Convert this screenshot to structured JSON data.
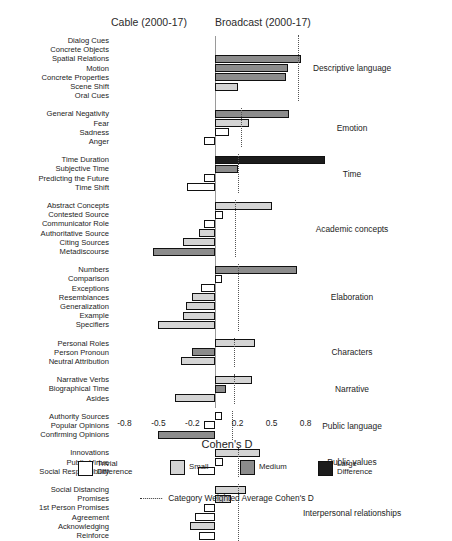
{
  "headers": {
    "left": "Cable (2000-17)",
    "right": "Broadcast (2000-17)"
  },
  "axis": {
    "title": "Cohen's D",
    "ticks": [
      "-0.8",
      "-0.5",
      "-0.2",
      "0.2",
      "0.5",
      "0.8"
    ],
    "tick_values": [
      -0.8,
      -0.5,
      -0.2,
      0.2,
      0.5,
      0.8
    ],
    "xlim": [
      -0.95,
      1.05
    ]
  },
  "legend": {
    "items": [
      {
        "key": "trivial",
        "label": "Trivial\nDifference",
        "color": "#ffffff"
      },
      {
        "key": "small",
        "label": "Small",
        "color": "#d4d4d4"
      },
      {
        "key": "medium",
        "label": "Medium",
        "color": "#8c8c8c"
      },
      {
        "key": "large",
        "label": "Large\nDifference",
        "color": "#1c1c1c"
      }
    ],
    "average_line": "Category Weighted Average Cohen's D"
  },
  "chart_data": {
    "type": "bar",
    "orientation": "horizontal",
    "title": "",
    "xlabel": "Cohen's D",
    "ylabel": "",
    "xlim": [
      -0.95,
      1.05
    ],
    "grid": false,
    "legend_position": "bottom",
    "annotations": [
      "Cable (2000-17)",
      "Broadcast (2000-17)"
    ],
    "effect_bins": {
      "trivial": "< 0.2",
      "small": "0.2 - 0.5",
      "medium": "0.5 - 0.8",
      "large": "> 0.8"
    },
    "groups": [
      {
        "category": "Descriptive language",
        "weighted_average": 0.73,
        "categories": [
          "Dialog Cues",
          "Concrete Objects",
          "Spatial Relations",
          "Motion",
          "Concrete Properties",
          "Scene Shift",
          "Oral Cues"
        ],
        "values": [
          0.0,
          0.0,
          0.76,
          0.64,
          0.63,
          0.2,
          0.0
        ],
        "effects": [
          "trivial",
          "trivial",
          "medium",
          "medium",
          "medium",
          "small",
          "trivial"
        ]
      },
      {
        "category": "Emotion",
        "weighted_average": 0.23,
        "categories": [
          "General Negativity",
          "Fear",
          "Sadness",
          "Anger"
        ],
        "values": [
          0.65,
          0.3,
          0.12,
          -0.1
        ],
        "effects": [
          "medium",
          "small",
          "trivial",
          "trivial"
        ]
      },
      {
        "category": "Time",
        "weighted_average": 0.2,
        "categories": [
          "Time Duration",
          "Subjective Time",
          "Predicting the Future",
          "Time Shift"
        ],
        "values": [
          0.97,
          0.2,
          -0.1,
          -0.25
        ],
        "effects": [
          "large",
          "medium",
          "trivial",
          "trivial"
        ]
      },
      {
        "category": "Academic concepts",
        "weighted_average": 0.18,
        "categories": [
          "Abstract Concepts",
          "Contested Source",
          "Communicator Role",
          "Authoritative Source",
          "Citing Sources",
          "Metadiscourse"
        ],
        "values": [
          0.5,
          0.07,
          -0.1,
          -0.14,
          -0.28,
          -0.55
        ],
        "effects": [
          "small",
          "trivial",
          "trivial",
          "small",
          "small",
          "medium"
        ]
      },
      {
        "category": "Elaboration",
        "weighted_average": 0.2,
        "categories": [
          "Numbers",
          "Comparison",
          "Exceptions",
          "Resemblances",
          "Generalization",
          "Example",
          "Specifiers"
        ],
        "values": [
          0.72,
          0.06,
          -0.12,
          -0.2,
          -0.26,
          -0.28,
          -0.5
        ],
        "effects": [
          "medium",
          "trivial",
          "trivial",
          "small",
          "small",
          "small",
          "small"
        ]
      },
      {
        "category": "Characters",
        "weighted_average": 0.17,
        "categories": [
          "Personal Roles",
          "Person Pronoun",
          "Neutral Attribution"
        ],
        "values": [
          0.35,
          -0.2,
          -0.3
        ],
        "effects": [
          "small",
          "medium",
          "small"
        ]
      },
      {
        "category": "Narrative",
        "weighted_average": 0.17,
        "categories": [
          "Narrative Verbs",
          "Biographical Time",
          "Asides"
        ],
        "values": [
          0.33,
          0.1,
          -0.35
        ],
        "effects": [
          "small",
          "medium",
          "small"
        ]
      },
      {
        "category": "Public language",
        "weighted_average": 0.15,
        "categories": [
          "Authority Sources",
          "Popular Opinions",
          "Confirming Opinions"
        ],
        "values": [
          0.06,
          -0.1,
          -0.5
        ],
        "effects": [
          "trivial",
          "trivial",
          "medium"
        ]
      },
      {
        "category": "Public values",
        "weighted_average": 0.2,
        "categories": [
          "Innovations",
          "Public Virtue",
          "Social Responsibility"
        ],
        "values": [
          0.4,
          0.07,
          -0.15
        ],
        "effects": [
          "small",
          "trivial",
          "trivial"
        ]
      },
      {
        "category": "Interpersonal relationships",
        "weighted_average": 0.2,
        "categories": [
          "Social Distancing",
          "Promises",
          "1st Person Promises",
          "Agreement",
          "Acknowledging",
          "Reinforce"
        ],
        "values": [
          0.27,
          0.14,
          -0.1,
          -0.18,
          -0.22,
          -0.14
        ],
        "effects": [
          "small",
          "small",
          "trivial",
          "trivial",
          "small",
          "trivial"
        ]
      }
    ]
  }
}
